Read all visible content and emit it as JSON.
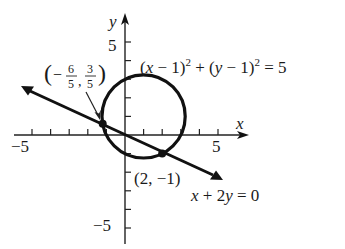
{
  "figure": {
    "type": "graph",
    "axes": {
      "x_label": "x",
      "y_label": "y",
      "x_tick_pos_label": "5",
      "x_tick_neg_label": "−5",
      "y_tick_pos_label": "5",
      "y_tick_neg_label": "−5",
      "x_range": [
        -5,
        6
      ],
      "y_range": [
        -6,
        6
      ]
    },
    "circle": {
      "equation_parts": {
        "lp1": "(",
        "x": "x",
        "minus1": " − 1)",
        "sq1": "2",
        "plus": " + (",
        "y": "y",
        "minus2": " − 1)",
        "sq2": "2",
        "eq": " = 5"
      },
      "center": [
        1,
        1
      ],
      "radius_squared": 5
    },
    "line": {
      "equation_parts": {
        "x": "x",
        "mid": " + 2",
        "y": "y",
        "end": " = 0"
      }
    },
    "intersections": [
      {
        "label_open": "(−",
        "x_num": "6",
        "x_den": "5",
        "comma": ",",
        "y_num": "3",
        "y_den": "5",
        "label_close": ")",
        "coords": [
          -1.2,
          0.6
        ]
      },
      {
        "label": "(2, −1)",
        "coords": [
          2,
          -1
        ]
      }
    ],
    "colors": {
      "ink": "#111111",
      "background": "#ffffff"
    }
  }
}
